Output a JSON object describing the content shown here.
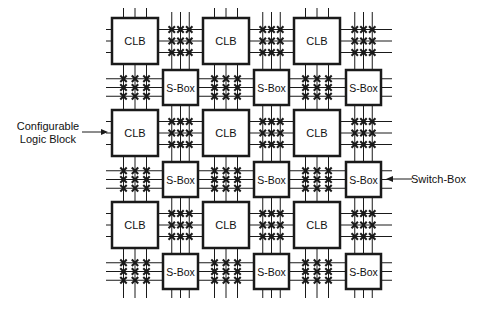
{
  "diagram": {
    "block_labels": {
      "clb": "CLB",
      "sbox": "S-Box"
    },
    "grid": {
      "clb_cols_x": [
        112,
        203,
        294
      ],
      "clb_rows_y": [
        18,
        110,
        202
      ],
      "clb_size": 46,
      "sbox_cols_x": [
        163,
        254,
        346
      ],
      "sbox_rows_y": [
        70,
        162,
        254
      ],
      "sbox_size": 35,
      "tracks_per_channel": 3
    },
    "annotations": [
      {
        "id": "clb",
        "text_lines": [
          "Configurable",
          "Logic Block"
        ],
        "arrow_to": "CLB"
      },
      {
        "id": "sbox",
        "text": "Switch-Box",
        "arrow_to": "S-Box"
      }
    ],
    "colors": {
      "stroke": "#1a1a1a",
      "background": "#ffffff"
    }
  },
  "annotations_text": {
    "clb_line1": "Configurable",
    "clb_line2": "Logic Block",
    "sbox": "Switch-Box"
  }
}
